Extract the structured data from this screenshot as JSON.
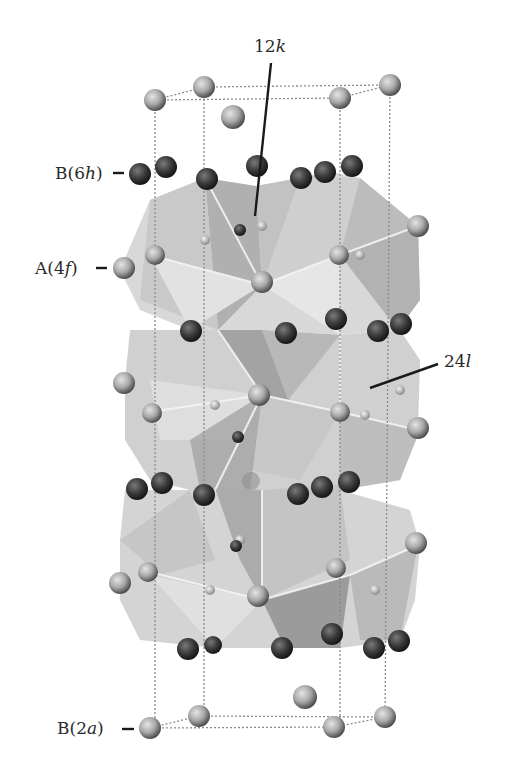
{
  "figure": {
    "labels": {
      "top": {
        "prefix": "12",
        "italic": "k",
        "suffix": ""
      },
      "b6h": {
        "prefix": "B(6",
        "italic": "h",
        "suffix": ")"
      },
      "a4f": {
        "prefix": "A(4",
        "italic": "f",
        "suffix": ")"
      },
      "right": {
        "prefix": "24",
        "italic": "l",
        "suffix": ""
      },
      "b2a": {
        "prefix": "B(2",
        "italic": "a",
        "suffix": ")"
      }
    },
    "colors": {
      "dark_atom": "#3a3a3a",
      "light_atom": "#a8a8a8",
      "polyhedron_light": "#d9d9d9",
      "polyhedron_mid": "#bdbdbd",
      "polyhedron_dark": "#9a9a9a",
      "cell_edge": "#8a8a8a",
      "leader_line": "#1a1a1a"
    }
  }
}
